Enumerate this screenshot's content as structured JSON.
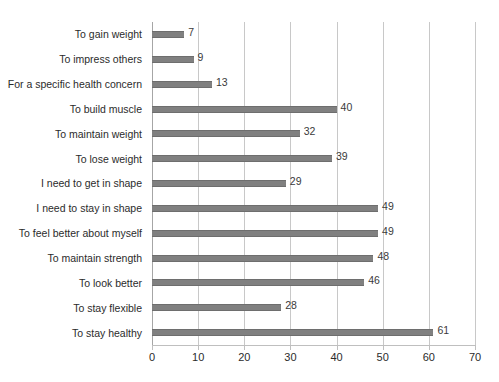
{
  "chart_data": {
    "type": "bar",
    "orientation": "horizontal",
    "title": "",
    "subtitle": "",
    "xlabel": "",
    "ylabel": "",
    "xlim": [
      0,
      70
    ],
    "xticks": [
      0,
      10,
      20,
      30,
      40,
      50,
      60,
      70
    ],
    "grid": "vertical",
    "legend": "none",
    "bar_color": "#808080",
    "gridline_color": "#c8c8c8",
    "axis_color": "#bfbfbf",
    "background": "#ffffff",
    "categories": [
      "To gain weight",
      "To impress others",
      "For a specific health concern",
      "To build muscle",
      "To maintain weight",
      "To lose weight",
      "I need to get in shape",
      "I need to stay in shape",
      "To feel better about myself",
      "To maintain strength",
      "To look better",
      "To stay flexible",
      "To stay healthy"
    ],
    "values": [
      7,
      9,
      13,
      40,
      32,
      39,
      29,
      49,
      49,
      48,
      46,
      28,
      61
    ],
    "data_labels": [
      "7",
      "9",
      "13",
      "40",
      "32",
      "39",
      "29",
      "49",
      "49",
      "48",
      "46",
      "28",
      "61"
    ],
    "xtick_labels": [
      "0",
      "10",
      "20",
      "30",
      "40",
      "50",
      "60",
      "70"
    ]
  }
}
